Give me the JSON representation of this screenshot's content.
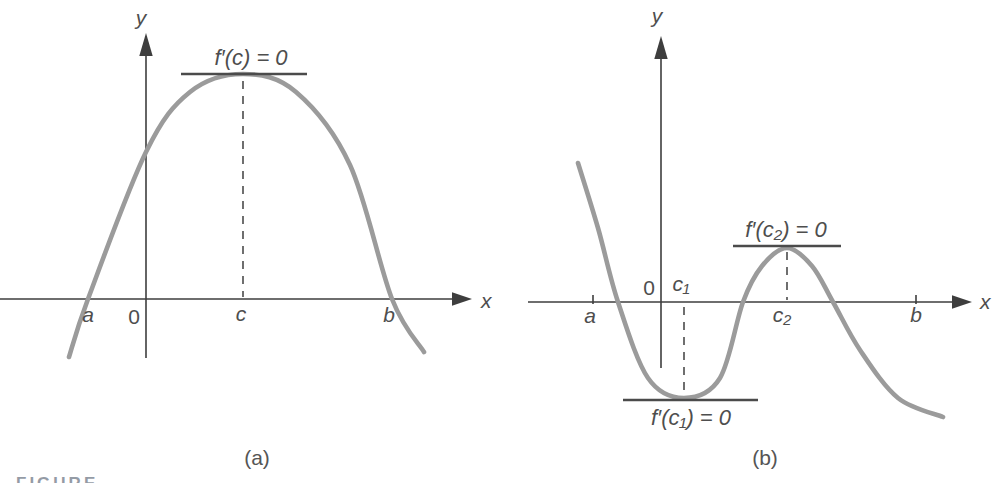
{
  "figure": {
    "background": "#ffffff",
    "partial_label": "FIGURE"
  },
  "colors": {
    "curve": "#9b9b9b",
    "axis": "#3e3e3e",
    "tangent": "#4b4b4b",
    "guide": "#4b4b4b",
    "text": "#4e4e4e",
    "caption": "#555555",
    "figure-label": "#3d4a5c"
  },
  "chart_data": [
    {
      "type": "line",
      "panel": "(a)",
      "xlabel": "x",
      "ylabel": "y",
      "origin_label": "0",
      "x_ticks": [
        "a",
        "c",
        "b"
      ],
      "annotations": [
        "f′(c) = 0"
      ],
      "legend": null,
      "grid": false,
      "curve_points": [
        [
          69,
          357
        ],
        [
          88,
          299
        ],
        [
          146,
          152
        ],
        [
          190,
          92
        ],
        [
          243,
          74
        ],
        [
          296,
          92
        ],
        [
          350,
          165
        ],
        [
          392,
          299
        ],
        [
          424,
          352
        ]
      ]
    },
    {
      "type": "line",
      "panel": "(b)",
      "xlabel": "x",
      "ylabel": "y",
      "origin_label": "0",
      "x_ticks": [
        "a",
        "c₁",
        "c₂",
        "b"
      ],
      "annotations": [
        "f′(c₂) = 0",
        "f′(c₁) = 0"
      ],
      "legend": null,
      "grid": false,
      "curve_points": [
        [
          578,
          163
        ],
        [
          598,
          228
        ],
        [
          618,
          302
        ],
        [
          648,
          378
        ],
        [
          684,
          398
        ],
        [
          720,
          378
        ],
        [
          743,
          302
        ],
        [
          762,
          266
        ],
        [
          787,
          248
        ],
        [
          812,
          266
        ],
        [
          833,
          302
        ],
        [
          860,
          350
        ],
        [
          898,
          398
        ],
        [
          943,
          417
        ]
      ]
    }
  ]
}
